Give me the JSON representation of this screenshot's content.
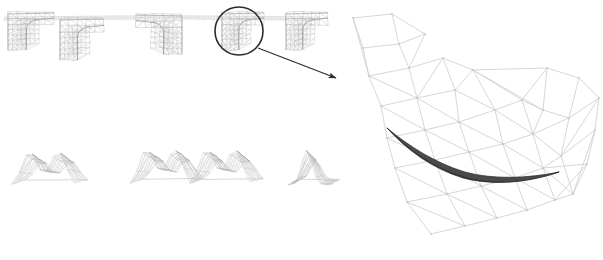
{
  "figure": {
    "background_color": "#ffffff",
    "width": 603,
    "height": 260,
    "mesh_line_color": "#b9b9b9",
    "mesh_line_color_dark": "#8d8d8d",
    "detail_mesh_color": "#cfcfcf",
    "crack_color": "#3a3a3a",
    "annotation_color": "#2a2a2a"
  },
  "panels": {
    "left_panel_label": "mesh-sequence-panel",
    "right_panel_label": "magnified-mesh-panel"
  },
  "annotation": {
    "circle": {
      "cx": 239,
      "cy": 31,
      "r": 24,
      "stroke": "#2b2b2b",
      "stroke_width": 1.6
    },
    "arrow": {
      "x1": 258,
      "y1": 48,
      "x2": 336,
      "y2": 78,
      "stroke": "#2b2b2b",
      "stroke_width": 1.1
    },
    "arrowhead_size": 7
  },
  "top_row": {
    "name": "hook-shaped-mesh-row",
    "count": 5,
    "items": [
      {
        "id": "hook-1",
        "x": 8,
        "y": 12,
        "w": 46,
        "h": 38,
        "flip": false
      },
      {
        "id": "hook-2",
        "x": 60,
        "y": 18,
        "w": 44,
        "h": 42,
        "flip": false
      },
      {
        "id": "hook-3",
        "x": 136,
        "y": 14,
        "w": 46,
        "h": 40,
        "flip": true
      },
      {
        "id": "hook-4",
        "x": 222,
        "y": 12,
        "w": 42,
        "h": 38,
        "flip": false
      },
      {
        "id": "hook-5",
        "x": 286,
        "y": 12,
        "w": 42,
        "h": 38,
        "flip": false
      }
    ],
    "connector_strip": {
      "x1": 4,
      "y1": 17,
      "x2": 320,
      "y2": 17
    }
  },
  "bottom_row": {
    "name": "tent-shaped-mesh-row",
    "count": 3,
    "items": [
      {
        "id": "tent-1",
        "x": 12,
        "y": 133,
        "w": 62,
        "h": 46,
        "peaks": 2
      },
      {
        "id": "tent-2",
        "x": 130,
        "y": 130,
        "w": 60,
        "h": 48,
        "peaks": 2
      },
      {
        "id": "tent-3",
        "x": 190,
        "y": 130,
        "w": 60,
        "h": 48,
        "peaks": 2
      },
      {
        "id": "tent-4",
        "x": 288,
        "y": 133,
        "w": 42,
        "h": 44,
        "peaks": 1
      }
    ]
  },
  "detail_mesh": {
    "name": "triangulated-wireframe",
    "node_count": 41,
    "edge_count": 98,
    "crack_curve_points": "[[55,128],[78,151],[104,170],[138,179],[168,180],[196,175],[212,170]]",
    "crack_width": 3.2,
    "bounds": {
      "x": 345,
      "y": 8,
      "w": 255,
      "h": 246
    }
  }
}
